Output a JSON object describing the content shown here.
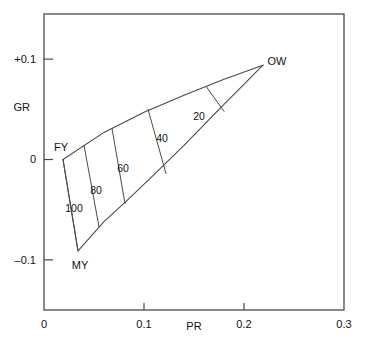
{
  "chart_data": {
    "type": "line",
    "title": "",
    "xlabel": "PR",
    "ylabel": "GR",
    "xlim": [
      0,
      0.3
    ],
    "ylim": [
      -0.15,
      0.145
    ],
    "grid": false,
    "legend": "none",
    "x_ticks": [
      {
        "value": 0,
        "label": "0"
      },
      {
        "value": 0.1,
        "label": "0.1"
      },
      {
        "value": 0.2,
        "label": "0.2"
      },
      {
        "value": 0.3,
        "label": "0.3"
      }
    ],
    "y_ticks": [
      {
        "value": 0.1,
        "label": "+0.1"
      },
      {
        "value": 0,
        "label": "0"
      },
      {
        "value": -0.1,
        "label": "–0.1"
      }
    ],
    "vertices": [
      {
        "name": "FY",
        "label": "FY",
        "x": 0.019,
        "y": 0.0
      },
      {
        "name": "MY",
        "label": "MY",
        "x": 0.034,
        "y": -0.091
      },
      {
        "name": "OW",
        "label": "OW",
        "x": 0.219,
        "y": 0.094
      }
    ],
    "boundaries": [
      {
        "name": "upper-boundary",
        "from": "FY",
        "to": "OW",
        "points": [
          [
            0.019,
            0.0
          ],
          [
            0.06,
            0.027
          ],
          [
            0.1,
            0.047
          ],
          [
            0.14,
            0.064
          ],
          [
            0.18,
            0.08
          ],
          [
            0.219,
            0.094
          ]
        ]
      },
      {
        "name": "lower-boundary",
        "from": "MY",
        "to": "OW",
        "points": [
          [
            0.034,
            -0.091
          ],
          [
            0.06,
            -0.062
          ],
          [
            0.085,
            -0.039
          ],
          [
            0.11,
            -0.015
          ],
          [
            0.14,
            0.014
          ],
          [
            0.175,
            0.05
          ],
          [
            0.219,
            0.094
          ]
        ]
      },
      {
        "name": "closing-boundary",
        "from": "FY",
        "to": "MY",
        "points": [
          [
            0.019,
            0.0
          ],
          [
            0.034,
            -0.091
          ]
        ]
      }
    ],
    "contours": [
      {
        "label": "100",
        "value": 100,
        "points": [
          [
            0.019,
            0.0
          ],
          [
            0.034,
            -0.091
          ]
        ],
        "label_x": 0.03,
        "label_y": -0.048
      },
      {
        "label": "80",
        "value": 80,
        "points": [
          [
            0.04,
            0.014
          ],
          [
            0.055,
            -0.067
          ]
        ],
        "label_x": 0.052,
        "label_y": -0.03
      },
      {
        "label": "60",
        "value": 60,
        "points": [
          [
            0.068,
            0.031
          ],
          [
            0.081,
            -0.044
          ]
        ],
        "label_x": 0.079,
        "label_y": -0.008
      },
      {
        "label": "40",
        "value": 40,
        "points": [
          [
            0.104,
            0.05
          ],
          [
            0.122,
            -0.014
          ]
        ],
        "label_x": 0.118,
        "label_y": 0.021
      },
      {
        "label": "20",
        "value": 20,
        "points": [
          [
            0.162,
            0.073
          ],
          [
            0.18,
            0.048
          ]
        ],
        "label_x": 0.155,
        "label_y": 0.043
      }
    ],
    "colors": {
      "line": "#4a4a4a",
      "axis": "#4a4a4a",
      "text": "#111111",
      "background": "#ffffff"
    }
  }
}
